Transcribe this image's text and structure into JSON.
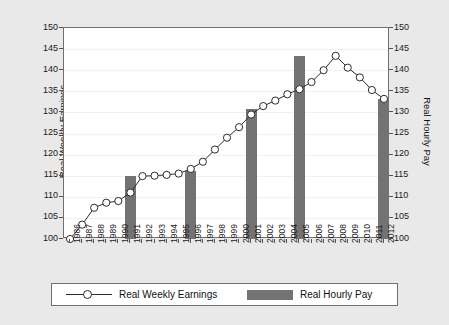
{
  "chart_data": {
    "type": "line",
    "title": "",
    "xlabel": "",
    "ylabel": "Real Weekly Earnings",
    "ylabel_right": "Real Hourly Pay",
    "ylim": [
      100,
      150
    ],
    "ylim_right": [
      100,
      150
    ],
    "yticks": [
      150,
      145,
      140,
      135,
      130,
      125,
      120,
      115,
      110,
      105,
      100
    ],
    "yticks_right": [
      150,
      145,
      140,
      135,
      130,
      125,
      120,
      115,
      110,
      105,
      100
    ],
    "grid": true,
    "legend_position": "bottom",
    "categories": [
      "1986",
      "1987",
      "1988",
      "1989",
      "1990",
      "1991",
      "1992",
      "1993",
      "1994",
      "1995",
      "1996",
      "1997",
      "1998",
      "1999",
      "2000",
      "2001",
      "2002",
      "2003",
      "2004",
      "2005",
      "2006",
      "2007",
      "2008",
      "2009",
      "2010",
      "2011",
      "2012"
    ],
    "series": [
      {
        "name": "Real Weekly Earnings",
        "type": "line",
        "marker": "circle",
        "color": "#2b2b2b",
        "values": [
          100.0,
          103.4,
          107.4,
          108.6,
          109.0,
          111.0,
          114.9,
          115.0,
          115.2,
          115.5,
          116.6,
          118.3,
          121.2,
          124.0,
          126.5,
          129.5,
          131.5,
          132.8,
          134.3,
          135.5,
          137.2,
          140.0,
          143.4,
          140.6,
          138.3,
          135.3,
          133.2
        ]
      },
      {
        "name": "Real Hourly Pay",
        "type": "bar",
        "color": "#737373",
        "bar_years": [
          "1991",
          "1996",
          "2001",
          "2005",
          "2012"
        ],
        "bar_values": [
          115.0,
          116.2,
          130.8,
          143.4,
          133.2
        ]
      }
    ]
  },
  "legend": {
    "entries": [
      {
        "label": "Real Weekly Earnings",
        "kind": "line-marker",
        "color": "#2b2b2b"
      },
      {
        "label": "Real Hourly Pay",
        "kind": "bar",
        "color": "#737373"
      }
    ]
  },
  "axes": {
    "left_title": "Real Weekly Earnings",
    "right_title": "Real Hourly Pay"
  }
}
